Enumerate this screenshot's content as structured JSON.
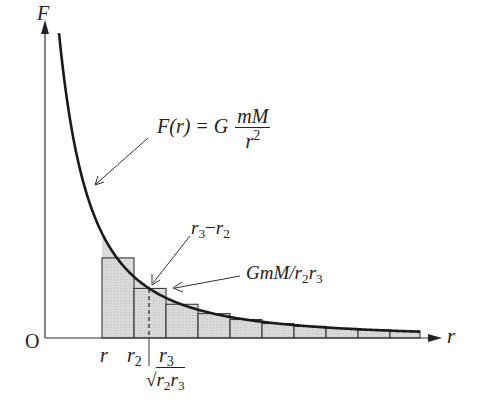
{
  "diagram": {
    "axes": {
      "y_label": "F",
      "x_label": "r",
      "origin_label": "O"
    },
    "curve": {
      "equation_lhs": "F(r) = G",
      "equation_num": "mM",
      "equation_den": "r",
      "equation_den_exp": "2"
    },
    "annotations": {
      "interval_label_a": "r",
      "interval_label_a_sub": "3",
      "interval_minus": "−",
      "interval_label_b": "r",
      "interval_label_b_sub": "2",
      "height_label": "GmM/",
      "height_r2": "r",
      "height_r2_sub": "2",
      "height_r3": "r",
      "height_r3_sub": "3"
    },
    "tick_labels": {
      "r": "r",
      "r2": "r",
      "r2_sub": "2",
      "r3": "r",
      "r3_sub": "3",
      "geo_mean_r2": "r",
      "geo_mean_r2_sub": "2",
      "geo_mean_r3": "r",
      "geo_mean_r3_sub": "3",
      "sqrt_symbol": "√"
    },
    "colors": {
      "line": "#1a1a1a",
      "fill": "#d6d6d6",
      "bar_edge": "#3a3a3a"
    }
  }
}
